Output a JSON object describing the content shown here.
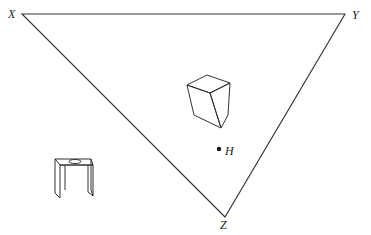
{
  "diagram": {
    "type": "triangle-with-objects",
    "vertices": {
      "X": {
        "label": "X",
        "x": 22,
        "y": 14
      },
      "Y": {
        "label": "Y",
        "x": 345,
        "y": 14
      },
      "Z": {
        "label": "Z",
        "x": 225,
        "y": 217
      }
    },
    "point": {
      "label": "H",
      "x": 219,
      "y": 149
    },
    "objects": [
      {
        "name": "cube",
        "description": "wireframe cube inside triangle"
      },
      {
        "name": "table-stand",
        "description": "small table/stand with circular hole on top, outside triangle at lower left"
      }
    ],
    "colors": {
      "stroke": "#333333",
      "background": "#ffffff"
    }
  }
}
